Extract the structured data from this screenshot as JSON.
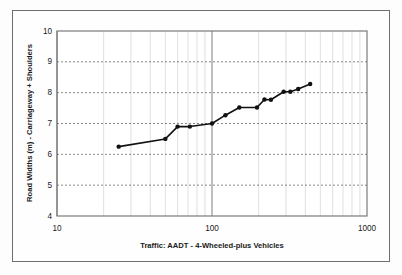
{
  "figure": {
    "background_color": "#fefefe",
    "frame_color": "#6e6e6e",
    "plot_border_color": "#808080",
    "series_color": "#000000",
    "gridline_color": "#808080"
  },
  "chart_data": {
    "type": "line",
    "title": "",
    "xlabel": "Traffic: AADT - 4-Wheeled-plus Vehicles",
    "ylabel": "Road Widths (m) - Carriageway + Shoulders",
    "xscale": "log",
    "yscale": "linear",
    "xlim": [
      10,
      1000
    ],
    "ylim": [
      4,
      10
    ],
    "xticks": [
      10,
      100,
      1000
    ],
    "xtick_labels": [
      "10",
      "100",
      "1000"
    ],
    "yticks": [
      4,
      5,
      6,
      7,
      8,
      9,
      10
    ],
    "ytick_labels": [
      "4",
      "5",
      "6",
      "7",
      "8",
      "9",
      "10"
    ],
    "grid": {
      "x_minor": true,
      "x_major": true,
      "y_major": true,
      "y_style": "dashed"
    },
    "legend": null,
    "marker": "circle",
    "series": [
      {
        "name": "Road Width vs Traffic",
        "x": [
          25,
          50,
          60,
          72,
          100,
          122,
          150,
          195,
          218,
          240,
          290,
          320,
          360,
          430
        ],
        "y": [
          6.25,
          6.5,
          6.9,
          6.9,
          7.0,
          7.27,
          7.52,
          7.52,
          7.78,
          7.77,
          8.03,
          8.03,
          8.12,
          8.28
        ]
      }
    ]
  },
  "xaxis_title": "Traffic: AADT - 4-Wheeled-plus Vehicles",
  "yaxis_title": "Road Widths (m) - Carriageway + Shoulders",
  "tick_10": "10",
  "tick_100": "100",
  "tick_1000": "1000",
  "y_10": "10",
  "y_9": "9",
  "y_8": "8",
  "y_7": "7",
  "y_6": "6",
  "y_5": "5",
  "y_4": "4"
}
